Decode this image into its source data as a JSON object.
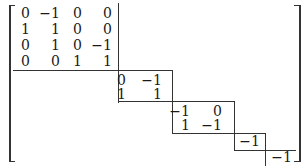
{
  "matrix": {
    "block1": {
      "rows": [
        [
          "0",
          "−1",
          "0",
          "0"
        ],
        [
          "1",
          "1",
          "0",
          "0"
        ],
        [
          "0",
          "1",
          "0",
          "−1"
        ],
        [
          "0",
          "0",
          "1",
          "1"
        ]
      ]
    },
    "block2": {
      "rows": [
        [
          "0",
          "−1"
        ],
        [
          "1",
          "1"
        ]
      ]
    },
    "block3": {
      "rows": [
        [
          "−1",
          "0"
        ],
        [
          "1",
          "−1"
        ]
      ]
    },
    "block4": {
      "rows": [
        [
          "−1"
        ]
      ]
    },
    "block5": {
      "rows": [
        [
          "−1"
        ]
      ]
    }
  }
}
